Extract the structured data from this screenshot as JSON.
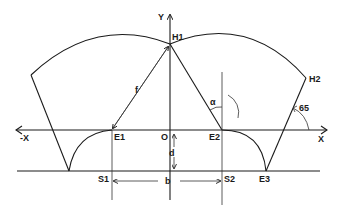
{
  "diagram": {
    "type": "geometric construction",
    "axes": {
      "y_label": "Y",
      "x_label": "X",
      "neg_x_label": "-X",
      "origin_label": "O"
    },
    "points": {
      "H1": "H1",
      "H2": "H2",
      "E1": "E1",
      "E2": "E2",
      "E3": "E3",
      "S1": "S1",
      "S2": "S2"
    },
    "dimensions": {
      "f": "f",
      "b": "b",
      "d": "d",
      "alpha": "α",
      "angle": "65"
    },
    "colors": {
      "stroke": "#1a1a1a",
      "background": "#ffffff"
    }
  }
}
